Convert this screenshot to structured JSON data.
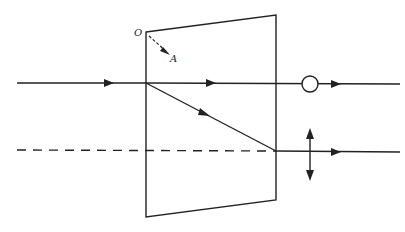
{
  "diagram": {
    "type": "birefringent-prism-ray-diagram",
    "labels": {
      "origin": "O",
      "axis_end": "A"
    },
    "colors": {
      "stroke": "#222222",
      "background": "#ffffff"
    },
    "elements": [
      "prism (trapezoid crystal)",
      "optic axis arrow O to A",
      "incident ray",
      "ordinary ray (polarization dot/circle)",
      "extraordinary ray (polarization double arrow)",
      "dashed reference line"
    ]
  }
}
